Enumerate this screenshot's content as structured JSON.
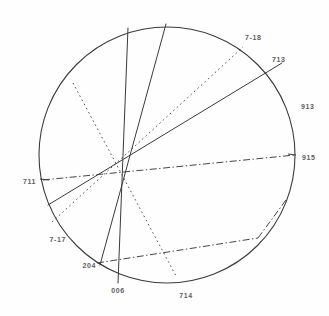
{
  "figure": {
    "type": "stereographic-projection",
    "title": "",
    "background_color": "#fefefe",
    "line_color": "#3b3b3b",
    "label_color": "#3a3a3a"
  },
  "circle": {
    "cx": 167,
    "cy": 155,
    "r": 128,
    "stroke": "#3b3b3b",
    "stroke_width": 1.1
  },
  "labels": [
    {
      "id": "label-7-18",
      "text": "7-18",
      "x": 245,
      "y": 40,
      "anchor": "start"
    },
    {
      "id": "label-713",
      "text": "713",
      "x": 272,
      "y": 62,
      "anchor": "start"
    },
    {
      "id": "label-913",
      "text": "913",
      "x": 301,
      "y": 109,
      "anchor": "start"
    },
    {
      "id": "label-915",
      "text": "915",
      "x": 302,
      "y": 160,
      "anchor": "start"
    },
    {
      "id": "label-711",
      "text": "711",
      "x": 36,
      "y": 184,
      "anchor": "end"
    },
    {
      "id": "label-7-17",
      "text": "7-17",
      "x": 66,
      "y": 242,
      "anchor": "end"
    },
    {
      "id": "label-204",
      "text": "204",
      "x": 96,
      "y": 268,
      "anchor": "end"
    },
    {
      "id": "label-006",
      "text": "006",
      "x": 118,
      "y": 293,
      "anchor": "middle"
    },
    {
      "id": "label-714",
      "text": "714",
      "x": 186,
      "y": 298,
      "anchor": "middle"
    }
  ],
  "chords": [
    {
      "id": "chord-vertical-006",
      "style": "solid",
      "x1": 128,
      "y1": 28,
      "x2": 118,
      "y2": 283
    },
    {
      "id": "chord-204-steep",
      "style": "solid",
      "x1": 166,
      "y1": 24,
      "x2": 100,
      "y2": 265
    },
    {
      "id": "chord-711-713",
      "style": "solid",
      "x1": 48,
      "y1": 205,
      "x2": 282,
      "y2": 63
    },
    {
      "id": "chord-711-915",
      "style": "dashdot",
      "x1": 43,
      "y1": 180,
      "x2": 295,
      "y2": 155
    },
    {
      "id": "chord-7-17-7-18",
      "style": "dotted",
      "x1": 52,
      "y1": 222,
      "x2": 243,
      "y2": 47
    },
    {
      "id": "chord-7-17-714-dot",
      "style": "dotted",
      "x1": 73,
      "y1": 83,
      "x2": 176,
      "y2": 276
    },
    {
      "id": "chord-204-714-dashdot",
      "style": "dashdot",
      "x1": 97,
      "y1": 263,
      "x2": 258,
      "y2": 238
    },
    {
      "id": "chord-913-arc-dashdot",
      "style": "dashdot",
      "x1": 258,
      "y1": 238,
      "x2": 286,
      "y2": 200
    }
  ],
  "tick_marks": [
    {
      "id": "tick-left-915",
      "x1": 40,
      "y1": 179,
      "x2": 49,
      "y2": 180
    },
    {
      "id": "tick-right-915",
      "x1": 288,
      "y1": 154,
      "x2": 296,
      "y2": 155
    }
  ]
}
